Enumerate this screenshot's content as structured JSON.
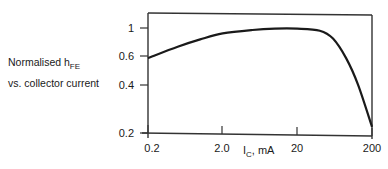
{
  "chart_data": {
    "type": "line",
    "title": "Normalised hFE vs. collector current",
    "title_line1": "Normalised h",
    "title_sub": "FE",
    "title_line2": "vs. collector current",
    "xlabel": "I",
    "xlabel_sub": "C",
    "xlabel_unit": ", mA",
    "ylabel": "Normalised hFE",
    "x_scale": "log",
    "y_scale": "log",
    "xlim": [
      0.2,
      200
    ],
    "ylim": [
      0.2,
      1.1
    ],
    "x_ticks": [
      "0.2",
      "2.0",
      "20",
      "200"
    ],
    "y_ticks": [
      "1",
      "0.6",
      "0.4",
      "0.2"
    ],
    "grid": false,
    "legend": null,
    "series": [
      {
        "name": "Normalised hFE",
        "x": [
          0.2,
          0.5,
          1,
          2,
          5,
          10,
          20,
          40,
          60,
          90,
          130,
          200
        ],
        "y": [
          0.63,
          0.75,
          0.84,
          0.92,
          0.97,
          0.99,
          0.99,
          0.96,
          0.85,
          0.63,
          0.42,
          0.22
        ]
      }
    ]
  }
}
